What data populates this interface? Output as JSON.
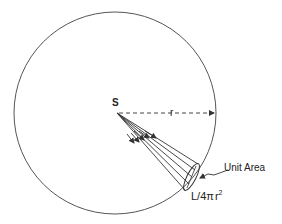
{
  "diagram": {
    "type": "inverse-square-law",
    "labels": {
      "source": "S",
      "radius": "r",
      "unit_area": "Unit Area",
      "flux_prefix": "L/4",
      "flux_pi": "π",
      "flux_r": "r",
      "flux_exp": "2"
    },
    "colors": {
      "stroke": "#333333",
      "background": "#ffffff"
    }
  }
}
